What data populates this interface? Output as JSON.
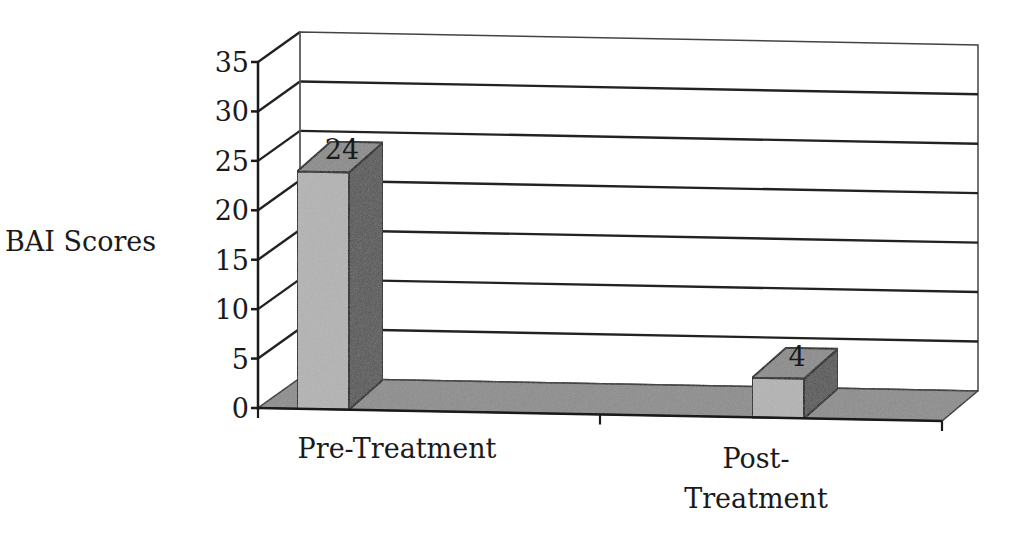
{
  "chart_data": {
    "type": "bar",
    "style": "3d",
    "title": "",
    "xlabel": "",
    "ylabel": "BAI Scores",
    "categories": [
      "Pre-Treatment",
      "Post-Treatment"
    ],
    "category_label_lines": [
      [
        "Pre-Treatment"
      ],
      [
        "Post-",
        "Treatment"
      ]
    ],
    "values": [
      24,
      4
    ],
    "data_labels": [
      "24",
      "4"
    ],
    "ylim": [
      0,
      35
    ],
    "yticks": [
      0,
      5,
      10,
      15,
      20,
      25,
      30,
      35
    ],
    "ytick_labels": [
      "0",
      "5",
      "10",
      "15",
      "20",
      "25",
      "30",
      "35"
    ],
    "grid": true,
    "legend": null
  },
  "colors": {
    "bar_front": "#b4b4b4",
    "bar_top": "#8a8a8a",
    "bar_side": "#555555",
    "floor": "#8c8c8c",
    "gridline": "#222222",
    "wall": "#ffffff"
  }
}
